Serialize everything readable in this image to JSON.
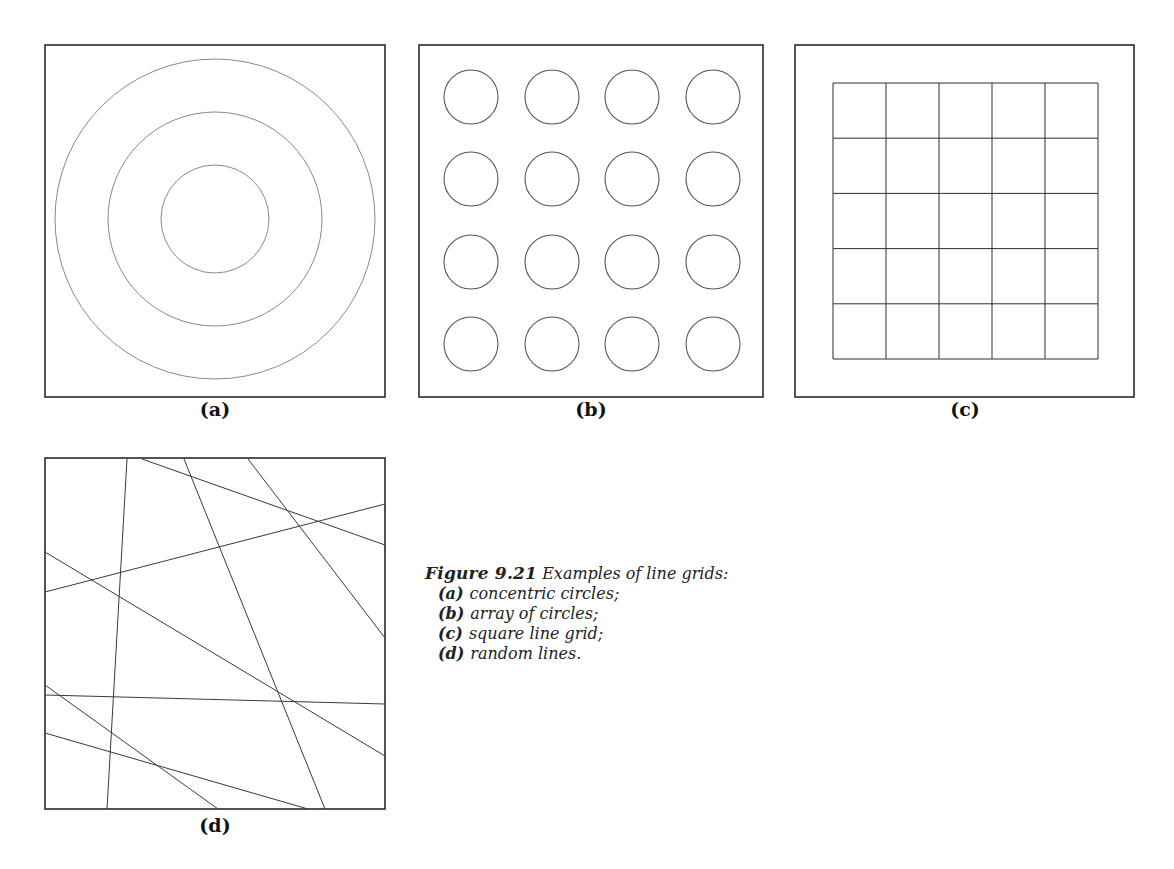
{
  "figure": {
    "number": "Figure 9.21",
    "title": "Examples of line grids:",
    "items": [
      {
        "key": "(a)",
        "text": "concentric circles;"
      },
      {
        "key": "(b)",
        "text": "array of circles;"
      },
      {
        "key": "(c)",
        "text": "square line grid;"
      },
      {
        "key": "(d)",
        "text": "random lines."
      }
    ]
  },
  "panels": {
    "a": {
      "label": "(a)",
      "description": "concentric circles",
      "box": {
        "x": 45,
        "y": 45,
        "w": 340,
        "h": 352
      },
      "center": {
        "x": 215,
        "y": 219
      },
      "radii": [
        54,
        107,
        160
      ]
    },
    "b": {
      "label": "(b)",
      "description": "array of circles",
      "box": {
        "x": 419,
        "y": 45,
        "w": 344,
        "h": 352
      },
      "rows": 4,
      "cols": 4,
      "col_centers": [
        471,
        552,
        632,
        713
      ],
      "row_centers": [
        97,
        179,
        262,
        344
      ],
      "radius": 27
    },
    "c": {
      "label": "(c)",
      "description": "square line grid",
      "box": {
        "x": 795,
        "y": 45,
        "w": 339,
        "h": 352
      },
      "grid": {
        "x": 833,
        "y": 83,
        "w": 265,
        "h": 276,
        "rows": 5,
        "cols": 5
      }
    },
    "d": {
      "label": "(d)",
      "description": "random lines",
      "box": {
        "x": 45,
        "y": 458,
        "w": 340,
        "h": 351
      },
      "lines": [
        [
          127,
          459,
          107,
          809
        ],
        [
          142,
          459,
          385,
          545
        ],
        [
          184,
          459,
          325,
          809
        ],
        [
          248,
          459,
          385,
          638
        ],
        [
          45,
          592,
          385,
          504
        ],
        [
          45,
          552,
          385,
          756
        ],
        [
          45,
          695,
          385,
          704
        ],
        [
          45,
          685,
          218,
          809
        ],
        [
          45,
          733,
          308,
          809
        ]
      ]
    }
  },
  "colors": {
    "frame": "#2a2a2a",
    "circle_a": "#8a8a8a",
    "circle_b": "#555555",
    "grid": "#2f2f2f",
    "lines_d": "#3a3a3a",
    "background": "#ffffff"
  }
}
